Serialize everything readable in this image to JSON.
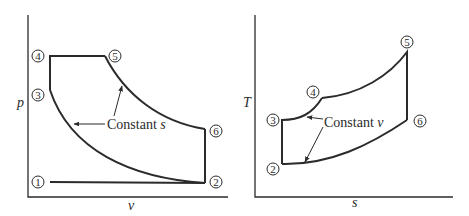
{
  "left_diagram": {
    "y_axis_label": "p",
    "x_axis_label": "v",
    "annotation": "Constant ",
    "annotation_var": "s",
    "points": [
      "1",
      "2",
      "3",
      "4",
      "5",
      "6"
    ]
  },
  "right_diagram": {
    "y_axis_label": "T",
    "x_axis_label": "s",
    "annotation": "Constant ",
    "annotation_var": "v",
    "points": [
      "2",
      "3",
      "4",
      "5",
      "6"
    ]
  },
  "colors": {
    "stroke": "#2b2b2b",
    "background": "#ffffff"
  }
}
